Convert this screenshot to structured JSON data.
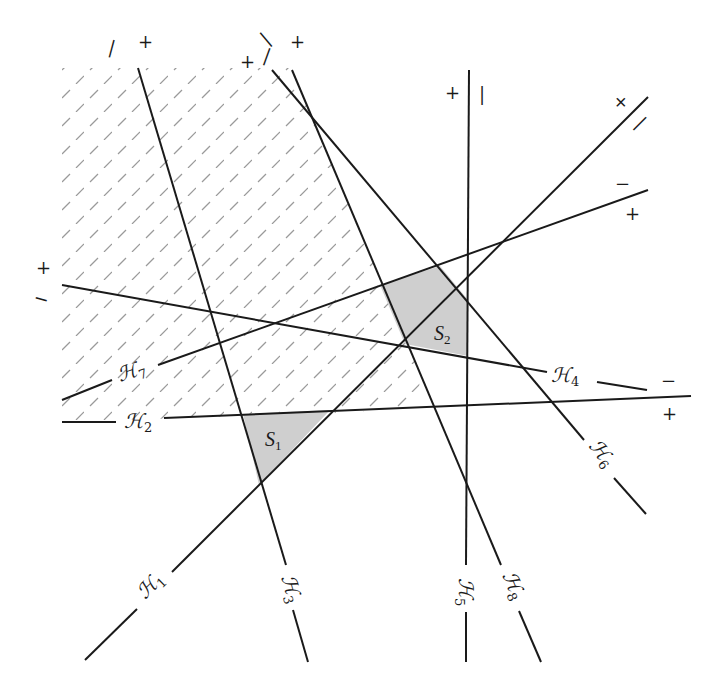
{
  "diagram": {
    "type": "hyperplane-arrangement",
    "hyperplanes": [
      {
        "id": "H1",
        "label": "ℋ",
        "sub": "1",
        "pos_side": "+",
        "neg_side": "−"
      },
      {
        "id": "H2",
        "label": "ℋ",
        "sub": "2",
        "pos_side": "+",
        "neg_side": "−"
      },
      {
        "id": "H3",
        "label": "ℋ",
        "sub": "3",
        "pos_side": "+",
        "neg_side": "−"
      },
      {
        "id": "H4",
        "label": "ℋ",
        "sub": "4",
        "pos_side": "+",
        "neg_side": "−"
      },
      {
        "id": "H5",
        "label": "ℋ",
        "sub": "5",
        "pos_side": "+",
        "neg_side": "−"
      },
      {
        "id": "H6",
        "label": "ℋ",
        "sub": "6",
        "pos_side": "+",
        "neg_side": "−"
      },
      {
        "id": "H7",
        "label": "ℋ",
        "sub": "7",
        "pos_side": "+",
        "neg_side": "−"
      },
      {
        "id": "H8",
        "label": "ℋ",
        "sub": "8",
        "pos_side": "+",
        "neg_side": "−"
      }
    ],
    "regions": [
      {
        "id": "S1",
        "label": "S",
        "sub": "1",
        "fill": "#cfcfcf"
      },
      {
        "id": "S2",
        "label": "S",
        "sub": "2",
        "fill": "#cfcfcf"
      }
    ],
    "hatched_region": {
      "style": "dashed diagonal hatching",
      "color": "#9a9a9a"
    },
    "signs": {
      "plus": "+",
      "minus": "−"
    }
  }
}
